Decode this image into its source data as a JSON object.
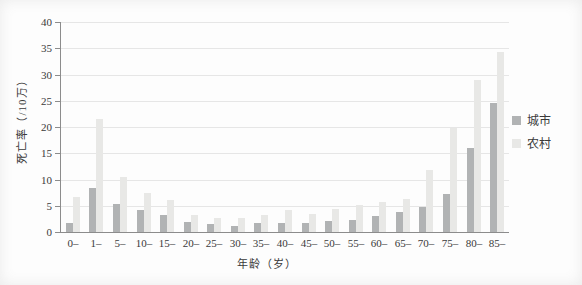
{
  "chart_data": {
    "type": "bar",
    "title": "",
    "xlabel": "年龄（岁）",
    "ylabel": "死亡率（/10万）",
    "categories": [
      "0–",
      "1–",
      "5–",
      "10–",
      "15–",
      "20–",
      "25–",
      "30–",
      "35–",
      "40–",
      "45–",
      "50–",
      "55–",
      "60–",
      "65–",
      "70–",
      "75–",
      "80–",
      "85–"
    ],
    "series": [
      {
        "name": "城市",
        "key": "urban",
        "color": "#b1b3b4",
        "values": [
          1.7,
          8.4,
          5.3,
          4.2,
          3.2,
          1.9,
          1.5,
          1.2,
          1.7,
          1.7,
          1.8,
          2.0,
          2.3,
          3.0,
          3.8,
          4.8,
          7.3,
          16.0,
          24.5
        ]
      },
      {
        "name": "农村",
        "key": "rural",
        "color": "#e8e8e6",
        "values": [
          6.7,
          21.5,
          10.4,
          7.5,
          6.1,
          3.2,
          2.7,
          2.7,
          3.3,
          4.2,
          3.4,
          4.4,
          5.1,
          5.8,
          6.2,
          11.9,
          19.9,
          29.0,
          34.3
        ]
      }
    ],
    "ylim": [
      0,
      40
    ],
    "yticks": [
      0,
      5,
      10,
      15,
      20,
      25,
      30,
      35,
      40
    ],
    "grid": true,
    "legend_position": "right"
  },
  "colors": {
    "axis": "#8c8c8c",
    "grid": "#e6e6e6",
    "text": "#3a3a3a",
    "background": "#fdfdfd"
  }
}
